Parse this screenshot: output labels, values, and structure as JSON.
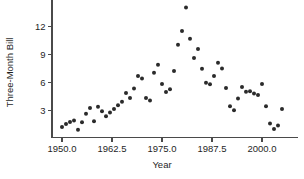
{
  "chart_data": {
    "type": "scatter",
    "title": "",
    "xlabel": "Year",
    "ylabel": "Three-Month Bill",
    "xlim": [
      1946.5,
      2006.5
    ],
    "ylim": [
      0.0,
      15.2
    ],
    "grid": false,
    "legend": null,
    "xticks": [
      1950.0,
      1962.5,
      1975.0,
      1987.5,
      2000.0
    ],
    "xticklabels": [
      "1950.0",
      "1962.5",
      "1975.0",
      "1987.5",
      "2000.0"
    ],
    "yticks": [
      3,
      6,
      9,
      12
    ],
    "yticklabels": [
      "3",
      "6",
      "9",
      "12"
    ],
    "marker": "filled-circle",
    "marker_color": "#2b2b2b",
    "marker_size": 3.0,
    "x": [
      1950,
      1951,
      1952,
      1953,
      1954,
      1955,
      1956,
      1957,
      1958,
      1959,
      1960,
      1961,
      1962,
      1963,
      1964,
      1965,
      1966,
      1967,
      1968,
      1969,
      1970,
      1971,
      1972,
      1973,
      1974,
      1975,
      1976,
      1977,
      1978,
      1979,
      1980,
      1981,
      1982,
      1983,
      1984,
      1985,
      1986,
      1987,
      1988,
      1989,
      1990,
      1991,
      1992,
      1993,
      1994,
      1995,
      1996,
      1997,
      1998,
      1999,
      2000,
      2001,
      2002,
      2003,
      2004,
      2005
    ],
    "y": [
      1.22,
      1.55,
      1.77,
      1.93,
      0.95,
      1.75,
      2.66,
      3.27,
      1.84,
      3.41,
      2.93,
      2.38,
      2.78,
      3.16,
      3.55,
      3.95,
      4.88,
      4.33,
      5.35,
      6.69,
      6.44,
      4.35,
      4.07,
      7.04,
      7.89,
      5.84,
      4.99,
      5.27,
      7.22,
      10.04,
      11.51,
      14.03,
      10.69,
      8.63,
      9.58,
      7.48,
      5.98,
      5.82,
      6.69,
      8.12,
      7.51,
      5.42,
      3.45,
      3.02,
      4.29,
      5.51,
      5.02,
      5.07,
      4.81,
      4.66,
      5.85,
      3.45,
      1.62,
      1.02,
      1.38,
      3.15
    ],
    "n_points": 56
  }
}
